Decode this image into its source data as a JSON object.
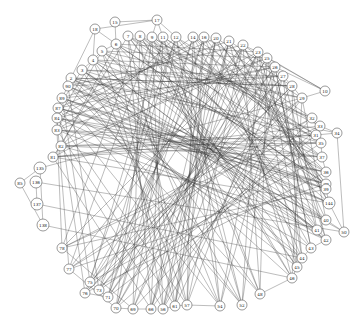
{
  "diagram": {
    "type": "network-graph",
    "layout": "circular",
    "node_radius": 5,
    "colors": {
      "edge": "#3a3a3a",
      "node_fill": "#ffffff",
      "node_stroke": "#555555",
      "label": "#222222"
    },
    "nodes": [
      {
        "id": "15",
        "x": 115,
        "y": 22
      },
      {
        "id": "17",
        "x": 157,
        "y": 20
      },
      {
        "id": "18",
        "x": 95,
        "y": 29
      },
      {
        "id": "7",
        "x": 128,
        "y": 36
      },
      {
        "id": "8",
        "x": 140,
        "y": 36
      },
      {
        "id": "9",
        "x": 152,
        "y": 37
      },
      {
        "id": "11",
        "x": 163,
        "y": 37
      },
      {
        "id": "12",
        "x": 176,
        "y": 37
      },
      {
        "id": "14",
        "x": 193,
        "y": 37
      },
      {
        "id": "16",
        "x": 204,
        "y": 37
      },
      {
        "id": "20",
        "x": 216,
        "y": 38
      },
      {
        "id": "21",
        "x": 229,
        "y": 41
      },
      {
        "id": "22",
        "x": 243,
        "y": 45
      },
      {
        "id": "6",
        "x": 116,
        "y": 44
      },
      {
        "id": "5",
        "x": 102,
        "y": 51
      },
      {
        "id": "4",
        "x": 93,
        "y": 60
      },
      {
        "id": "3",
        "x": 82,
        "y": 70
      },
      {
        "id": "2",
        "x": 71,
        "y": 78
      },
      {
        "id": "23",
        "x": 258,
        "y": 52
      },
      {
        "id": "25",
        "x": 267,
        "y": 58
      },
      {
        "id": "26",
        "x": 275,
        "y": 67
      },
      {
        "id": "27",
        "x": 283,
        "y": 76
      },
      {
        "id": "28",
        "x": 292,
        "y": 86
      },
      {
        "id": "29",
        "x": 302,
        "y": 98
      },
      {
        "id": "10",
        "x": 325,
        "y": 91
      },
      {
        "id": "32",
        "x": 312,
        "y": 118
      },
      {
        "id": "33",
        "x": 320,
        "y": 126
      },
      {
        "id": "34",
        "x": 337,
        "y": 133
      },
      {
        "id": "31",
        "x": 316,
        "y": 135
      },
      {
        "id": "35",
        "x": 321,
        "y": 143
      },
      {
        "id": "37",
        "x": 322,
        "y": 157
      },
      {
        "id": "36",
        "x": 326,
        "y": 172
      },
      {
        "id": "38",
        "x": 326,
        "y": 184
      },
      {
        "id": "39",
        "x": 326,
        "y": 189
      },
      {
        "id": "144",
        "x": 329,
        "y": 203
      },
      {
        "id": "40",
        "x": 326,
        "y": 220
      },
      {
        "id": "41",
        "x": 317,
        "y": 230
      },
      {
        "id": "50",
        "x": 344,
        "y": 232
      },
      {
        "id": "42",
        "x": 326,
        "y": 240
      },
      {
        "id": "43",
        "x": 311,
        "y": 248
      },
      {
        "id": "44",
        "x": 302,
        "y": 258
      },
      {
        "id": "45",
        "x": 297,
        "y": 267
      },
      {
        "id": "46",
        "x": 292,
        "y": 278
      },
      {
        "id": "48",
        "x": 260,
        "y": 294
      },
      {
        "id": "52",
        "x": 242,
        "y": 305
      },
      {
        "id": "54",
        "x": 220,
        "y": 306
      },
      {
        "id": "57",
        "x": 187,
        "y": 305
      },
      {
        "id": "61",
        "x": 175,
        "y": 306
      },
      {
        "id": "56",
        "x": 163,
        "y": 309
      },
      {
        "id": "66",
        "x": 151,
        "y": 309
      },
      {
        "id": "69",
        "x": 133,
        "y": 309
      },
      {
        "id": "70",
        "x": 116,
        "y": 308
      },
      {
        "id": "71",
        "x": 108,
        "y": 297
      },
      {
        "id": "73",
        "x": 99,
        "y": 290
      },
      {
        "id": "75",
        "x": 90,
        "y": 282
      },
      {
        "id": "76",
        "x": 85,
        "y": 293
      },
      {
        "id": "77",
        "x": 69,
        "y": 269
      },
      {
        "id": "78",
        "x": 62,
        "y": 248
      },
      {
        "id": "90",
        "x": 68,
        "y": 86
      },
      {
        "id": "89",
        "x": 62,
        "y": 98
      },
      {
        "id": "87",
        "x": 58,
        "y": 108
      },
      {
        "id": "84",
        "x": 57,
        "y": 118
      },
      {
        "id": "83",
        "x": 57,
        "y": 130
      },
      {
        "id": "82",
        "x": 61,
        "y": 146
      },
      {
        "id": "81",
        "x": 53,
        "y": 157
      },
      {
        "id": "135",
        "x": 40,
        "y": 168
      },
      {
        "id": "85",
        "x": 20,
        "y": 183
      },
      {
        "id": "136",
        "x": 36,
        "y": 182
      },
      {
        "id": "137",
        "x": 37,
        "y": 204
      },
      {
        "id": "138",
        "x": 43,
        "y": 225
      }
    ],
    "edges": [
      [
        "18",
        "17"
      ],
      [
        "18",
        "6"
      ],
      [
        "18",
        "2"
      ],
      [
        "15",
        "17"
      ],
      [
        "15",
        "6"
      ],
      [
        "17",
        "9"
      ],
      [
        "17",
        "11"
      ],
      [
        "17",
        "12"
      ],
      [
        "18",
        "4"
      ],
      [
        "135",
        "85"
      ],
      [
        "85",
        "138"
      ],
      [
        "136",
        "137"
      ],
      [
        "135",
        "138"
      ],
      [
        "136",
        "50"
      ],
      [
        "137",
        "44"
      ],
      [
        "138",
        "46"
      ],
      [
        "135",
        "29"
      ],
      [
        "10",
        "23"
      ],
      [
        "10",
        "25"
      ],
      [
        "10",
        "26"
      ],
      [
        "10",
        "29"
      ],
      [
        "34",
        "33"
      ],
      [
        "34",
        "31"
      ],
      [
        "34",
        "50"
      ],
      [
        "50",
        "144"
      ],
      [
        "50",
        "40"
      ],
      [
        "2",
        "46"
      ],
      [
        "2",
        "34"
      ],
      [
        "2",
        "50"
      ],
      [
        "3",
        "44"
      ],
      [
        "3",
        "42"
      ],
      [
        "4",
        "48"
      ],
      [
        "4",
        "41"
      ],
      [
        "5",
        "52"
      ],
      [
        "5",
        "40"
      ],
      [
        "6",
        "54"
      ],
      [
        "6",
        "38"
      ],
      [
        "7",
        "57"
      ],
      [
        "7",
        "37"
      ],
      [
        "8",
        "61"
      ],
      [
        "8",
        "36"
      ],
      [
        "9",
        "56"
      ],
      [
        "9",
        "35"
      ],
      [
        "11",
        "66"
      ],
      [
        "11",
        "31"
      ],
      [
        "12",
        "69"
      ],
      [
        "12",
        "33"
      ],
      [
        "14",
        "70"
      ],
      [
        "14",
        "32"
      ],
      [
        "16",
        "71"
      ],
      [
        "16",
        "29"
      ],
      [
        "20",
        "73"
      ],
      [
        "20",
        "28"
      ],
      [
        "21",
        "75"
      ],
      [
        "21",
        "27"
      ],
      [
        "22",
        "76"
      ],
      [
        "22",
        "26"
      ],
      [
        "22",
        "77"
      ],
      [
        "23",
        "78"
      ],
      [
        "23",
        "81"
      ],
      [
        "25",
        "82"
      ],
      [
        "25",
        "83"
      ],
      [
        "26",
        "84"
      ],
      [
        "26",
        "87"
      ],
      [
        "27",
        "89"
      ],
      [
        "27",
        "90"
      ],
      [
        "28",
        "2"
      ],
      [
        "28",
        "3"
      ],
      [
        "29",
        "4"
      ],
      [
        "29",
        "5"
      ],
      [
        "32",
        "6"
      ],
      [
        "32",
        "7"
      ],
      [
        "33",
        "8"
      ],
      [
        "31",
        "9"
      ],
      [
        "35",
        "11"
      ],
      [
        "37",
        "12"
      ],
      [
        "36",
        "14"
      ],
      [
        "38",
        "16"
      ],
      [
        "39",
        "20"
      ],
      [
        "144",
        "21"
      ],
      [
        "40",
        "22"
      ],
      [
        "41",
        "23"
      ],
      [
        "42",
        "25"
      ],
      [
        "43",
        "26"
      ],
      [
        "44",
        "27"
      ],
      [
        "45",
        "28"
      ],
      [
        "46",
        "29"
      ],
      [
        "48",
        "90"
      ],
      [
        "52",
        "89"
      ],
      [
        "54",
        "87"
      ],
      [
        "57",
        "84"
      ],
      [
        "61",
        "83"
      ],
      [
        "56",
        "82"
      ],
      [
        "66",
        "81"
      ],
      [
        "69",
        "78"
      ],
      [
        "70",
        "77"
      ],
      [
        "71",
        "76"
      ],
      [
        "73",
        "90"
      ],
      [
        "75",
        "89"
      ],
      [
        "76",
        "87"
      ],
      [
        "77",
        "84"
      ],
      [
        "78",
        "83"
      ],
      [
        "81",
        "82"
      ],
      [
        "90",
        "45"
      ],
      [
        "89",
        "44"
      ],
      [
        "87",
        "43"
      ],
      [
        "84",
        "42"
      ],
      [
        "83",
        "41"
      ],
      [
        "82",
        "40"
      ],
      [
        "81",
        "144"
      ],
      [
        "78",
        "39"
      ],
      [
        "77",
        "38"
      ],
      [
        "76",
        "36"
      ],
      [
        "75",
        "37"
      ],
      [
        "73",
        "35"
      ],
      [
        "71",
        "31"
      ],
      [
        "70",
        "33"
      ],
      [
        "69",
        "32"
      ],
      [
        "66",
        "29"
      ],
      [
        "56",
        "28"
      ],
      [
        "61",
        "27"
      ],
      [
        "57",
        "26"
      ],
      [
        "54",
        "25"
      ],
      [
        "52",
        "23"
      ],
      [
        "48",
        "22"
      ],
      [
        "46",
        "21"
      ],
      [
        "45",
        "20"
      ],
      [
        "44",
        "16"
      ],
      [
        "43",
        "14"
      ],
      [
        "42",
        "12"
      ],
      [
        "41",
        "11"
      ],
      [
        "40",
        "9"
      ],
      [
        "144",
        "8"
      ],
      [
        "39",
        "7"
      ],
      [
        "38",
        "6"
      ],
      [
        "36",
        "5"
      ],
      [
        "37",
        "4"
      ],
      [
        "35",
        "3"
      ],
      [
        "31",
        "2"
      ],
      [
        "2",
        "90"
      ],
      [
        "90",
        "89"
      ],
      [
        "89",
        "87"
      ],
      [
        "87",
        "84"
      ],
      [
        "84",
        "83"
      ],
      [
        "3",
        "4"
      ],
      [
        "4",
        "5"
      ],
      [
        "5",
        "6"
      ],
      [
        "22",
        "23"
      ],
      [
        "23",
        "25"
      ],
      [
        "25",
        "26"
      ],
      [
        "26",
        "27"
      ],
      [
        "27",
        "28"
      ],
      [
        "28",
        "29"
      ],
      [
        "32",
        "33"
      ],
      [
        "35",
        "37"
      ],
      [
        "37",
        "36"
      ],
      [
        "38",
        "39"
      ],
      [
        "39",
        "144"
      ],
      [
        "40",
        "41"
      ],
      [
        "42",
        "43"
      ],
      [
        "43",
        "44"
      ],
      [
        "44",
        "45"
      ],
      [
        "45",
        "46"
      ],
      [
        "46",
        "48"
      ],
      [
        "54",
        "57"
      ],
      [
        "57",
        "61"
      ],
      [
        "61",
        "56"
      ],
      [
        "66",
        "69"
      ],
      [
        "69",
        "70"
      ],
      [
        "71",
        "73"
      ],
      [
        "73",
        "75"
      ],
      [
        "2",
        "28"
      ],
      [
        "3",
        "27"
      ],
      [
        "4",
        "26"
      ],
      [
        "5",
        "25"
      ],
      [
        "6",
        "23"
      ],
      [
        "90",
        "22"
      ],
      [
        "89",
        "21"
      ],
      [
        "87",
        "20"
      ],
      [
        "84",
        "16"
      ],
      [
        "83",
        "14"
      ],
      [
        "82",
        "12"
      ],
      [
        "2",
        "42"
      ],
      [
        "3",
        "41"
      ],
      [
        "90",
        "40"
      ],
      [
        "89",
        "144"
      ],
      [
        "87",
        "39"
      ],
      [
        "84",
        "38"
      ],
      [
        "83",
        "36"
      ],
      [
        "82",
        "37"
      ],
      [
        "81",
        "35"
      ],
      [
        "7",
        "45"
      ],
      [
        "8",
        "46"
      ],
      [
        "9",
        "48"
      ],
      [
        "11",
        "52"
      ],
      [
        "12",
        "54"
      ],
      [
        "14",
        "57"
      ],
      [
        "16",
        "61"
      ],
      [
        "20",
        "56"
      ],
      [
        "21",
        "66"
      ],
      [
        "22",
        "69"
      ],
      [
        "23",
        "70"
      ],
      [
        "25",
        "71"
      ],
      [
        "26",
        "73"
      ],
      [
        "27",
        "75"
      ],
      [
        "28",
        "76"
      ],
      [
        "29",
        "77"
      ],
      [
        "32",
        "78"
      ],
      [
        "33",
        "81"
      ],
      [
        "31",
        "82"
      ],
      [
        "35",
        "83"
      ],
      [
        "37",
        "84"
      ],
      [
        "36",
        "87"
      ],
      [
        "38",
        "89"
      ],
      [
        "39",
        "90"
      ],
      [
        "144",
        "2"
      ],
      [
        "40",
        "3"
      ],
      [
        "41",
        "4"
      ],
      [
        "42",
        "5"
      ],
      [
        "43",
        "6"
      ],
      [
        "44",
        "7"
      ],
      [
        "45",
        "8"
      ],
      [
        "46",
        "9"
      ],
      [
        "48",
        "11"
      ],
      [
        "52",
        "12"
      ],
      [
        "54",
        "14"
      ],
      [
        "57",
        "16"
      ],
      [
        "61",
        "20"
      ],
      [
        "56",
        "21"
      ],
      [
        "66",
        "22"
      ],
      [
        "69",
        "23"
      ],
      [
        "70",
        "25"
      ],
      [
        "71",
        "26"
      ],
      [
        "73",
        "27"
      ],
      [
        "75",
        "28"
      ],
      [
        "76",
        "29"
      ],
      [
        "77",
        "32"
      ],
      [
        "78",
        "33"
      ],
      [
        "81",
        "31"
      ],
      [
        "82",
        "35"
      ],
      [
        "83",
        "37"
      ],
      [
        "84",
        "36"
      ],
      [
        "87",
        "38"
      ],
      [
        "89",
        "39"
      ],
      [
        "90",
        "144"
      ],
      [
        "25",
        "48"
      ],
      [
        "26",
        "52"
      ],
      [
        "27",
        "54"
      ],
      [
        "23",
        "56"
      ],
      [
        "22",
        "57"
      ],
      [
        "21",
        "61"
      ],
      [
        "20",
        "66"
      ],
      [
        "16",
        "70"
      ],
      [
        "14",
        "71"
      ],
      [
        "12",
        "73"
      ],
      [
        "11",
        "75"
      ],
      [
        "9",
        "77"
      ],
      [
        "8",
        "78"
      ],
      [
        "7",
        "81"
      ],
      [
        "6",
        "82"
      ],
      [
        "5",
        "83"
      ],
      [
        "4",
        "84"
      ],
      [
        "3",
        "87"
      ],
      [
        "23",
        "45"
      ],
      [
        "25",
        "44"
      ],
      [
        "26",
        "43"
      ],
      [
        "27",
        "42"
      ],
      [
        "28",
        "41"
      ],
      [
        "29",
        "40"
      ],
      [
        "22",
        "144"
      ],
      [
        "21",
        "39"
      ],
      [
        "20",
        "38"
      ],
      [
        "2",
        "52"
      ],
      [
        "3",
        "54"
      ],
      [
        "4",
        "57"
      ],
      [
        "5",
        "61"
      ],
      [
        "6",
        "56"
      ],
      [
        "7",
        "66"
      ],
      [
        "8",
        "69"
      ],
      [
        "9",
        "70"
      ],
      [
        "11",
        "71"
      ],
      [
        "12",
        "76"
      ]
    ]
  }
}
